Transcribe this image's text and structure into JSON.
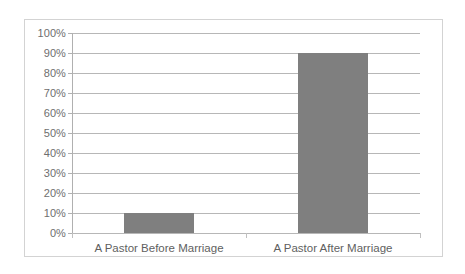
{
  "chart_data": {
    "type": "bar",
    "title": "",
    "subtitle": "",
    "xlabel": "",
    "ylabel": "",
    "categories": [
      "A Pastor Before Marriage",
      "A Pastor After Marriage"
    ],
    "values": [
      10,
      90
    ],
    "value_suffix": "%",
    "ylim": [
      0,
      100
    ],
    "ytick_labels": [
      "100%",
      "90%",
      "80%",
      "70%",
      "60%",
      "50%",
      "40%",
      "30%",
      "20%",
      "10%",
      "0%"
    ],
    "ytick_values": [
      100,
      90,
      80,
      70,
      60,
      50,
      40,
      30,
      20,
      10,
      0
    ],
    "grid": true,
    "legend": false,
    "legend_position": "none",
    "series": [
      {
        "name": "",
        "values": [
          10,
          90
        ],
        "color": "#7f7f7f"
      }
    ]
  },
  "colors": {
    "bar": "#7f7f7f",
    "gridline": "#b7b7b7",
    "axis": "#b0b0b0",
    "frame_border": "#d3d3d3",
    "tick_label": "#6e6e6e",
    "category_label": "#5f5f5f",
    "background": "#ffffff"
  }
}
